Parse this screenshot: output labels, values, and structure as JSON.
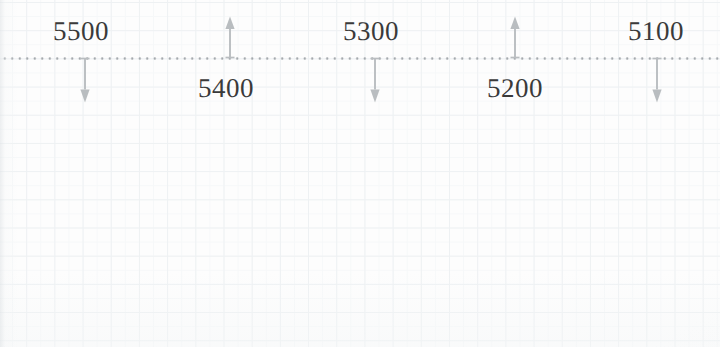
{
  "sheet": {
    "width": 720,
    "height": 347,
    "background_color": "#fdfdfd",
    "grid_color": "#eef1f3",
    "grid_spacing_px": 28
  },
  "reference_line": {
    "name": "dotted-baseline",
    "style": "dotted",
    "color": "#9ea3a7",
    "y": 58,
    "x_start": 0,
    "x_end": 720
  },
  "markers": [
    {
      "label": "5500",
      "direction": "down",
      "arrow_x": 85,
      "arrow_length": 45,
      "label_x": 53,
      "label_y": 18,
      "label_side": "above",
      "color": "#b9bdc0"
    },
    {
      "label": "5400",
      "direction": "up",
      "arrow_x": 230,
      "arrow_length": 42,
      "label_x": 198,
      "label_y": 75,
      "label_side": "below",
      "color": "#b9bdc0"
    },
    {
      "label": "5300",
      "direction": "down",
      "arrow_x": 375,
      "arrow_length": 45,
      "label_x": 343,
      "label_y": 18,
      "label_side": "above",
      "color": "#b9bdc0"
    },
    {
      "label": "5200",
      "direction": "up",
      "arrow_x": 515,
      "arrow_length": 42,
      "label_x": 487,
      "label_y": 75,
      "label_side": "below",
      "color": "#b9bdc0"
    },
    {
      "label": "5100",
      "direction": "down",
      "arrow_x": 657,
      "arrow_length": 45,
      "label_x": 628,
      "label_y": 18,
      "label_side": "above",
      "color": "#b9bdc0"
    }
  ],
  "chart_data": {
    "type": "scatter",
    "title": "",
    "xlabel": "",
    "ylabel": "",
    "annotation_style": "arrow-callouts-on-dotted-baseline",
    "categories": [
      "5500",
      "5400",
      "5300",
      "5200",
      "5100"
    ],
    "values": [
      5500,
      5400,
      5300,
      5200,
      5100
    ],
    "x_positions_px": [
      85,
      230,
      375,
      515,
      657
    ],
    "arrow_directions": [
      "down",
      "up",
      "down",
      "up",
      "down"
    ],
    "baseline_y_px": 58,
    "grid": true,
    "legend": "none"
  }
}
